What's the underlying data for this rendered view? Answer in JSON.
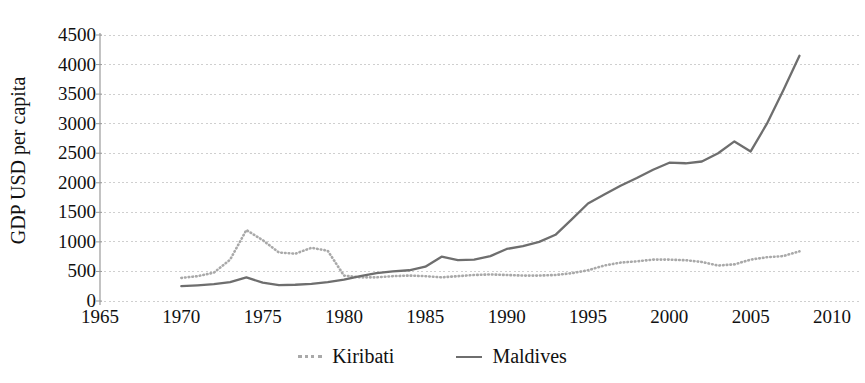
{
  "chart_data": {
    "type": "line",
    "title": "",
    "subtitle": "",
    "xlabel": "",
    "ylabel": "GDP USD per capita",
    "xlim": [
      1965,
      2010
    ],
    "ylim": [
      0,
      4500
    ],
    "xticks": [
      "1965",
      "1970",
      "1975",
      "1980",
      "1985",
      "1990",
      "1995",
      "2000",
      "2005",
      "2010"
    ],
    "yticks": [
      "0",
      "500",
      "1000",
      "1500",
      "2000",
      "2500",
      "3000",
      "3500",
      "4000",
      "4500"
    ],
    "grid": "horizontal-dotted",
    "legend_position": "bottom-center",
    "colors": {
      "kiribati": "#a9a9a9",
      "maldives": "#6e6e6e",
      "grid": "#cfcfcf",
      "axis": "#9a9a9a",
      "text": "#111111",
      "background": "#ffffff"
    },
    "series": [
      {
        "name": "Kiribati",
        "style": "dotted",
        "color": "#a9a9a9",
        "x": [
          1970,
          1971,
          1972,
          1973,
          1974,
          1975,
          1976,
          1977,
          1978,
          1979,
          1980,
          1981,
          1982,
          1983,
          1984,
          1985,
          1986,
          1987,
          1988,
          1989,
          1990,
          1991,
          1992,
          1993,
          1994,
          1995,
          1996,
          1997,
          1998,
          1999,
          2000,
          2001,
          2002,
          2003,
          2004,
          2005,
          2006,
          2007,
          2008
        ],
        "values": [
          390,
          420,
          480,
          700,
          1200,
          1030,
          820,
          800,
          900,
          850,
          430,
          400,
          400,
          420,
          430,
          420,
          400,
          420,
          440,
          450,
          440,
          430,
          430,
          440,
          470,
          520,
          600,
          650,
          670,
          700,
          700,
          690,
          660,
          600,
          620,
          700,
          740,
          760,
          840
        ]
      },
      {
        "name": "Maldives",
        "style": "solid",
        "color": "#6e6e6e",
        "x": [
          1970,
          1971,
          1972,
          1973,
          1974,
          1975,
          1976,
          1977,
          1978,
          1979,
          1980,
          1981,
          1982,
          1983,
          1984,
          1985,
          1986,
          1987,
          1988,
          1989,
          1990,
          1991,
          1992,
          1993,
          1994,
          1995,
          1996,
          1997,
          1998,
          1999,
          2000,
          2001,
          2002,
          2003,
          2004,
          2005,
          2006,
          2007,
          2008
        ],
        "values": [
          250,
          265,
          285,
          320,
          400,
          310,
          270,
          275,
          290,
          320,
          360,
          420,
          470,
          500,
          520,
          580,
          750,
          690,
          700,
          760,
          880,
          930,
          1000,
          1120,
          1380,
          1650,
          1800,
          1950,
          2080,
          2220,
          2340,
          2330,
          2360,
          2500,
          2700,
          2530,
          3000,
          3560,
          4150
        ]
      }
    ]
  },
  "legend": {
    "items": [
      {
        "label": "Kiribati",
        "style": "dotted"
      },
      {
        "label": "Maldives",
        "style": "solid"
      }
    ]
  }
}
